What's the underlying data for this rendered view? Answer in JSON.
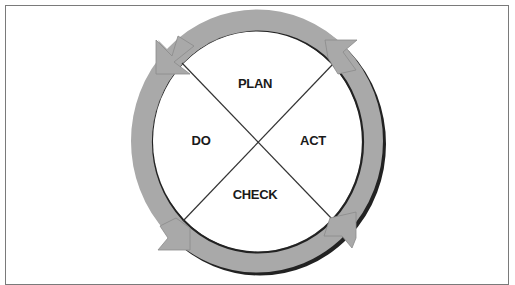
{
  "diagram": {
    "type": "cycle",
    "nodes": [
      {
        "id": "plan",
        "label": "PLAN",
        "position": "top"
      },
      {
        "id": "act",
        "label": "ACT",
        "position": "right"
      },
      {
        "id": "check",
        "label": "CHECK",
        "position": "bottom"
      },
      {
        "id": "do",
        "label": "DO",
        "position": "left"
      }
    ],
    "flow": "counter-clockwise arrows around ring",
    "colors": {
      "ring": "#a9a9a9",
      "ring_shadow": "#222222",
      "frame": "#7a7a7a",
      "divider": "#333333",
      "text": "#1a1a1a"
    }
  }
}
